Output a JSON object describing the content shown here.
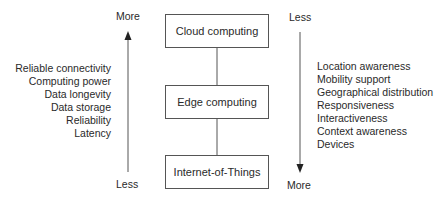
{
  "diagram": {
    "layers": [
      {
        "label": "Cloud computing"
      },
      {
        "label": "Edge computing"
      },
      {
        "label": "Internet-of-Things"
      }
    ],
    "left_axis": {
      "top_label": "More",
      "bottom_label": "Less",
      "direction": "up",
      "properties": [
        "Reliable connectivity",
        "Computing power",
        "Data longevity",
        "Data storage",
        "Reliability",
        "Latency"
      ]
    },
    "right_axis": {
      "top_label": "Less",
      "bottom_label": "More",
      "direction": "down",
      "properties": [
        "Location awareness",
        "Mobility support",
        "Geographical distribution",
        "Responsiveness",
        "Interactiveness",
        "Context awareness",
        "Devices"
      ]
    },
    "colors": {
      "line": "#555555",
      "text": "#2a2a2a",
      "background": "#ffffff"
    }
  }
}
